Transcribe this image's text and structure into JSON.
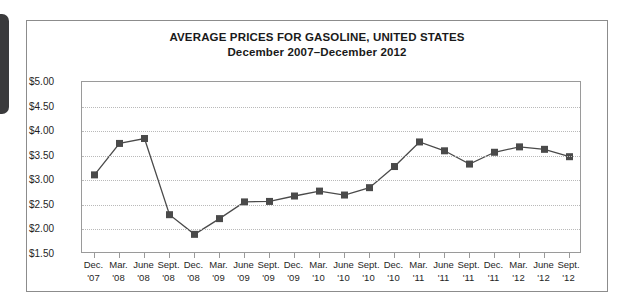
{
  "figure": {
    "title": "AVERAGE PRICES FOR GASOLINE, UNITED STATES",
    "subtitle": "December 2007–December 2012",
    "frame_color": "#8c8c8c",
    "plot_border_color": "#9a9a9a",
    "gridline_color": "#b9b9b9",
    "series_color": "#4a4a4a",
    "marker_color": "#4a4a4a",
    "edge_tab_color": "#3a3a3c"
  },
  "chart_data": {
    "type": "line",
    "title": "AVERAGE PRICES FOR GASOLINE, UNITED STATES",
    "subtitle": "December 2007–December 2012",
    "xlabel": "",
    "ylabel": "",
    "ylim": [
      1.5,
      5.0
    ],
    "ytick_values": [
      5.0,
      4.5,
      4.0,
      3.5,
      3.0,
      2.5,
      2.0,
      1.5
    ],
    "ytick_labels": [
      "$5.00",
      "$4.50",
      "$4.00",
      "$3.50",
      "$3.00",
      "$2.50",
      "$2.00",
      "$1.50"
    ],
    "grid": true,
    "grid_axis": "y",
    "legend": false,
    "marker": "square",
    "categories": [
      "Dec. '07",
      "Mar. '08",
      "June '08",
      "Sept. '08",
      "Dec. '08",
      "Mar. '09",
      "June '09",
      "Sept. '09",
      "Dec. '09",
      "Mar. '10",
      "June '10",
      "Sept. '10",
      "Dec. '10",
      "Mar. '11",
      "June '11",
      "Sept. '11",
      "Dec. '11",
      "Mar. '12",
      "June '12",
      "Sept. '12"
    ],
    "categories_split": [
      [
        "Dec.",
        "'07"
      ],
      [
        "Mar.",
        "'08"
      ],
      [
        "June",
        "'08"
      ],
      [
        "Sept.",
        "'08"
      ],
      [
        "Dec.",
        "'08"
      ],
      [
        "Mar.",
        "'09"
      ],
      [
        "June",
        "'09"
      ],
      [
        "Sept.",
        "'09"
      ],
      [
        "Dec.",
        "'09"
      ],
      [
        "Mar.",
        "'10"
      ],
      [
        "June",
        "'10"
      ],
      [
        "Sept.",
        "'10"
      ],
      [
        "Dec.",
        "'10"
      ],
      [
        "Mar.",
        "'11"
      ],
      [
        "June",
        "'11"
      ],
      [
        "Sept.",
        "'11"
      ],
      [
        "Dec.",
        "'11"
      ],
      [
        "Mar.",
        "'12"
      ],
      [
        "June",
        "'12"
      ],
      [
        "Sept.",
        "'12"
      ]
    ],
    "values": [
      3.11,
      3.75,
      3.85,
      2.3,
      1.9,
      2.22,
      2.56,
      2.57,
      2.68,
      2.78,
      2.7,
      2.85,
      3.28,
      3.78,
      3.6,
      3.33,
      3.57,
      3.68,
      3.63,
      3.48
    ]
  }
}
